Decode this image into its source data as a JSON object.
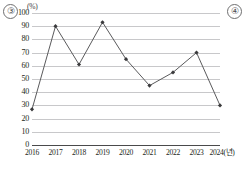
{
  "labels": {
    "question_left": "③",
    "question_right": "④",
    "unit": "(%)"
  },
  "chart_data": {
    "type": "line",
    "title": "",
    "xlabel": "2024(년)",
    "ylabel": "(%)",
    "categories": [
      "2016",
      "2017",
      "2018",
      "2019",
      "2020",
      "2021",
      "2022",
      "2023",
      "2024(년)"
    ],
    "x_tick_labels": [
      "2016",
      "2017",
      "2018",
      "2019",
      "2020",
      "2021",
      "2022",
      "2023",
      "2024(년)"
    ],
    "y_tick_labels": [
      "0",
      "10",
      "20",
      "30",
      "40",
      "50",
      "60",
      "70",
      "80",
      "90",
      "100"
    ],
    "y_ticks": [
      0,
      10,
      20,
      30,
      40,
      50,
      60,
      70,
      80,
      90,
      100
    ],
    "ylim": [
      0,
      100
    ],
    "values": [
      27,
      90,
      61,
      93,
      65,
      45,
      55,
      70,
      30
    ],
    "series": [
      {
        "name": "",
        "values": [
          27,
          90,
          61,
          93,
          65,
          45,
          55,
          70,
          30
        ]
      }
    ],
    "grid": true,
    "grid_axis": "y",
    "legend": false,
    "legend_position": "none",
    "marker": "diamond",
    "line_color": "#5a5a5c",
    "marker_color": "#3a3a3c",
    "grid_color": "#c8c8ca",
    "axis_color": "#4a4a4b"
  }
}
